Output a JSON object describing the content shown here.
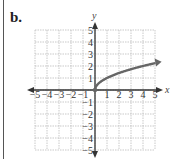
{
  "panel": {
    "label": "b."
  },
  "chart_data": {
    "type": "line",
    "title": "",
    "xlabel": "x",
    "ylabel": "y",
    "xlim": [
      -5,
      5
    ],
    "ylim": [
      -5,
      5
    ],
    "grid": true,
    "x_ticks": [
      -5,
      -4,
      -3,
      -2,
      -1,
      1,
      2,
      3,
      4,
      5
    ],
    "y_ticks": [
      5,
      4,
      3,
      2,
      1,
      -1,
      -2,
      -3,
      -4,
      -5
    ],
    "x_tick_labels": [
      "−5",
      "−4",
      "−3",
      "−2",
      "−1",
      "1",
      "2",
      "3",
      "4",
      "5"
    ],
    "y_tick_labels": [
      "5",
      "4",
      "3",
      "2",
      "1",
      "−1",
      "−2",
      "−3",
      "−4",
      "−5"
    ],
    "series": [
      {
        "name": "y = √x",
        "x": [
          0,
          0.25,
          0.5,
          1,
          1.5,
          2,
          2.5,
          3,
          3.5,
          4,
          4.5,
          5,
          5.2
        ],
        "y": [
          0,
          0.5,
          0.71,
          1,
          1.22,
          1.41,
          1.58,
          1.73,
          1.87,
          2,
          2.12,
          2.24,
          2.28
        ],
        "start_point": [
          0,
          0
        ],
        "end_arrow": true
      }
    ],
    "colors": {
      "curve": "#666666",
      "axis": "#333333",
      "grid": "#bbbbbb"
    }
  }
}
